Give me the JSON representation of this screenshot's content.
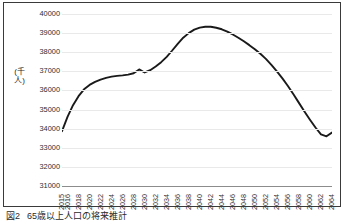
{
  "figure": {
    "caption_number": "図2",
    "caption_text": "65歳以上人口の将来推計"
  },
  "axis": {
    "y_title": "(千人)",
    "y_ticks": [
      "40000",
      "39000",
      "38000",
      "37000",
      "36000",
      "35000",
      "34000",
      "33000",
      "32000",
      "31000"
    ],
    "x_ticks": [
      "2015",
      "2016",
      "2018",
      "2020",
      "2022",
      "2024",
      "2026",
      "2028",
      "2030",
      "2032",
      "2034",
      "2036",
      "2038",
      "2040",
      "2042",
      "2044",
      "2046",
      "2048",
      "2050",
      "2052",
      "2054",
      "2056",
      "2058",
      "2060",
      "2062",
      "2064"
    ]
  },
  "colors": {
    "line": "#1a1a1a",
    "grid": "#e9e9e9",
    "frame": "#3a3a3a",
    "text": "#2e2e2e",
    "background": "#ffffff"
  },
  "chart_data": {
    "type": "line",
    "title": "",
    "xlabel": "",
    "ylabel": "(千人)",
    "ylim": [
      31000,
      40000
    ],
    "xlim": [
      2015,
      2064
    ],
    "grid": true,
    "legend": "none",
    "y_tick_step": 1000,
    "x": [
      2015,
      2016,
      2017,
      2018,
      2019,
      2020,
      2021,
      2022,
      2023,
      2024,
      2025,
      2026,
      2027,
      2028,
      2029,
      2030,
      2031,
      2032,
      2033,
      2034,
      2035,
      2036,
      2037,
      2038,
      2039,
      2040,
      2041,
      2042,
      2043,
      2044,
      2045,
      2046,
      2047,
      2048,
      2049,
      2050,
      2051,
      2052,
      2053,
      2054,
      2055,
      2056,
      2057,
      2058,
      2059,
      2060,
      2061,
      2062,
      2063,
      2064
    ],
    "series": [
      {
        "name": "65歳以上人口",
        "values": [
          33870,
          34620,
          35230,
          35700,
          36060,
          36290,
          36450,
          36570,
          36660,
          36720,
          36760,
          36790,
          36830,
          36900,
          37100,
          36940,
          37060,
          37250,
          37480,
          37760,
          38090,
          38440,
          38760,
          39000,
          39180,
          39290,
          39330,
          39330,
          39280,
          39200,
          39080,
          38930,
          38760,
          38570,
          38370,
          38160,
          37920,
          37650,
          37340,
          37000,
          36630,
          36230,
          35800,
          35350,
          34900,
          34470,
          34060,
          33700,
          33600,
          33800
        ]
      }
    ],
    "annotations": {
      "peak_year": 2041,
      "peak_value": 39330,
      "start_value": 33870,
      "end_value": 33800,
      "notch_year": 2029
    }
  }
}
